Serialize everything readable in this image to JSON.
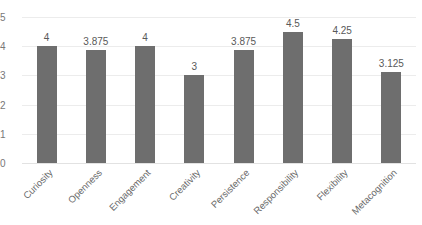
{
  "chart_data": {
    "type": "bar",
    "title": "",
    "xlabel": "",
    "ylabel": "",
    "ylim": [
      0,
      5
    ],
    "yticks": [
      "0",
      "1",
      "2",
      "3",
      "4",
      "5"
    ],
    "grid": true,
    "legend": "none",
    "bar_color": "#6e6e6e",
    "gridline_color": "#ececec",
    "categories": [
      "Curiosity",
      "Openness",
      "Engagement",
      "Creativity",
      "Persistence",
      "Responsibility",
      "Flexibility",
      "Metacognition"
    ],
    "values": [
      4,
      3.875,
      4,
      3,
      3.875,
      4.5,
      4.25,
      3.125
    ],
    "value_labels": [
      "4",
      "3.875",
      "4",
      "3",
      "3.875",
      "4.5",
      "4.25",
      "3.125"
    ]
  }
}
